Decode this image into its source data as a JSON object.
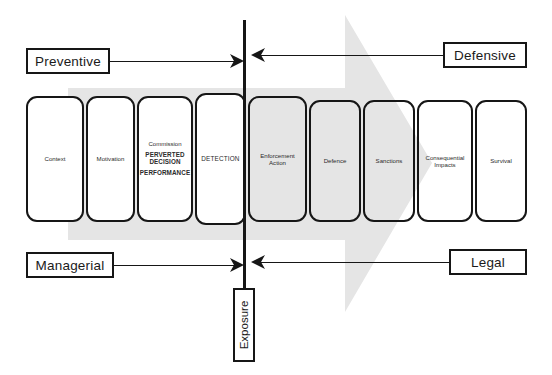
{
  "diagram": {
    "background_arrow": {
      "name": "process-flow-arrow",
      "direction": "right",
      "color": "#e4e4e4"
    },
    "spine": {
      "name": "detection-spine",
      "color": "#161616"
    },
    "process_boxes": [
      {
        "id": "context",
        "label": "Context",
        "shaded": false,
        "style": "plain"
      },
      {
        "id": "motivation",
        "label": "Motivation",
        "shaded": false,
        "style": "plain"
      },
      {
        "id": "commission",
        "label": "Commission PERVERTED DECISION PERFORMANCE",
        "shaded": false,
        "style": "commission",
        "line1": "Commission",
        "line2": "PERVERTED\nDECISION",
        "line2a": "PERVERTED",
        "line2b": "DECISION",
        "line3": "PERFORMANCE"
      },
      {
        "id": "detection",
        "label": "DETECTION",
        "shaded": false,
        "style": "detection"
      },
      {
        "id": "enforcement",
        "label": "Enforcement Action",
        "shaded": true,
        "style": "plain"
      },
      {
        "id": "defence",
        "label": "Defence",
        "shaded": true,
        "style": "plain"
      },
      {
        "id": "sanctions",
        "label": "Sanctions",
        "shaded": true,
        "style": "plain"
      },
      {
        "id": "consequential",
        "label": "Consequential Impacts",
        "shaded": true,
        "style": "plain"
      },
      {
        "id": "survival",
        "label": "Survival",
        "shaded": false,
        "style": "plain"
      }
    ],
    "callouts": [
      {
        "id": "preventive",
        "label": "Preventive",
        "position": "top-left",
        "arrow": "right"
      },
      {
        "id": "defensive",
        "label": "Defensive",
        "position": "top-right",
        "arrow": "left"
      },
      {
        "id": "managerial",
        "label": "Managerial",
        "position": "bottom-left",
        "arrow": "right"
      },
      {
        "id": "legal",
        "label": "Legal",
        "position": "bottom-right",
        "arrow": "left"
      }
    ],
    "exposure": {
      "id": "exposure",
      "label": "Exposure",
      "orientation": "vertical"
    }
  }
}
